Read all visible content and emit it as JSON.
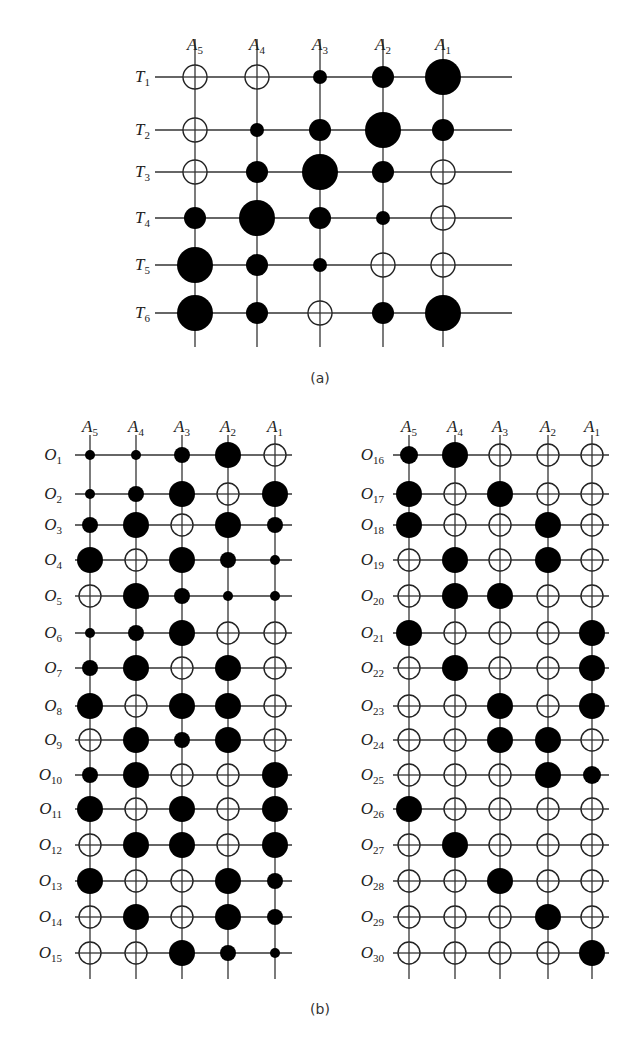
{
  "figure": {
    "part_a": {
      "caption": "(a)",
      "columns": [
        "A5",
        "A4",
        "A3",
        "A2",
        "A1"
      ],
      "rows": [
        "T1",
        "T2",
        "T3",
        "T4",
        "T5",
        "T6"
      ],
      "legend_note": "0 = empty circle, 1-4 = filled circle of increasing size"
    },
    "part_b": {
      "caption": "(b)",
      "columns": [
        "A5",
        "A4",
        "A3",
        "A2",
        "A1"
      ],
      "left_rows": [
        "O1",
        "O2",
        "O3",
        "O4",
        "O5",
        "O6",
        "O7",
        "O8",
        "O9",
        "O10",
        "O11",
        "O12",
        "O13",
        "O14",
        "O15"
      ],
      "right_rows": [
        "O16",
        "O17",
        "O18",
        "O19",
        "O20",
        "O21",
        "O22",
        "O23",
        "O24",
        "O25",
        "O26",
        "O27",
        "O28",
        "O29",
        "O30"
      ]
    }
  },
  "chart_data": [
    {
      "type": "heatmap",
      "title": "(a)",
      "xlabel": "Attributes",
      "ylabel": "Templates",
      "x": [
        "A5",
        "A4",
        "A3",
        "A2",
        "A1"
      ],
      "y": [
        "T1",
        "T2",
        "T3",
        "T4",
        "T5",
        "T6"
      ],
      "encoding": "circle size: 0 empty, 1 small, 2 medium, 3 large, 4 extra large",
      "values": [
        [
          0,
          0,
          1,
          2,
          4
        ],
        [
          0,
          1,
          2,
          4,
          2
        ],
        [
          0,
          2,
          4,
          2,
          0
        ],
        [
          2,
          4,
          2,
          1,
          0
        ],
        [
          4,
          2,
          1,
          0,
          0
        ],
        [
          4,
          2,
          0,
          2,
          4
        ]
      ]
    },
    {
      "type": "heatmap",
      "title": "(b) left",
      "x": [
        "A5",
        "A4",
        "A3",
        "A2",
        "A1"
      ],
      "y": [
        "O1",
        "O2",
        "O3",
        "O4",
        "O5",
        "O6",
        "O7",
        "O8",
        "O9",
        "O10",
        "O11",
        "O12",
        "O13",
        "O14",
        "O15"
      ],
      "encoding": "circle size: 0 empty, 1 small, 2 medium, 3 large",
      "values": [
        [
          1,
          1,
          2,
          3,
          0
        ],
        [
          1,
          2,
          3,
          0,
          3
        ],
        [
          2,
          3,
          0,
          3,
          2
        ],
        [
          3,
          0,
          3,
          2,
          1
        ],
        [
          0,
          3,
          2,
          1,
          1
        ],
        [
          1,
          2,
          3,
          0,
          0
        ],
        [
          2,
          3,
          0,
          3,
          0
        ],
        [
          3,
          0,
          3,
          3,
          0
        ],
        [
          0,
          3,
          2,
          3,
          0
        ],
        [
          2,
          3,
          0,
          0,
          3
        ],
        [
          3,
          0,
          3,
          0,
          3
        ],
        [
          0,
          3,
          3,
          0,
          3
        ],
        [
          3,
          0,
          0,
          3,
          2
        ],
        [
          0,
          3,
          0,
          3,
          2
        ],
        [
          0,
          0,
          3,
          2,
          1
        ]
      ]
    },
    {
      "type": "heatmap",
      "title": "(b) right",
      "x": [
        "A5",
        "A4",
        "A3",
        "A2",
        "A1"
      ],
      "y": [
        "O16",
        "O17",
        "O18",
        "O19",
        "O20",
        "O21",
        "O22",
        "O23",
        "O24",
        "O25",
        "O26",
        "O27",
        "O28",
        "O29",
        "O30"
      ],
      "encoding": "circle size: 0 empty, 1 small, 2 medium, 3 large",
      "values": [
        [
          2,
          3,
          0,
          0,
          0
        ],
        [
          3,
          0,
          3,
          0,
          0
        ],
        [
          3,
          0,
          0,
          3,
          0
        ],
        [
          0,
          3,
          0,
          3,
          0
        ],
        [
          0,
          3,
          3,
          0,
          0
        ],
        [
          3,
          0,
          0,
          0,
          3
        ],
        [
          0,
          3,
          0,
          0,
          3
        ],
        [
          0,
          0,
          3,
          0,
          3
        ],
        [
          0,
          0,
          3,
          3,
          0
        ],
        [
          0,
          0,
          0,
          3,
          2
        ],
        [
          3,
          0,
          0,
          0,
          0
        ],
        [
          0,
          3,
          0,
          0,
          0
        ],
        [
          0,
          0,
          3,
          0,
          0
        ],
        [
          0,
          0,
          0,
          3,
          0
        ],
        [
          0,
          0,
          0,
          0,
          3
        ]
      ]
    }
  ]
}
